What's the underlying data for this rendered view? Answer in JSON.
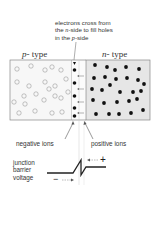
{
  "diagram": {
    "caption_lines": [
      "electrons cross from",
      "the n-side to fill holes",
      "in the p-side"
    ],
    "caption_parts": [
      [
        {
          "t": "electrons cross from",
          "i": false
        }
      ],
      [
        {
          "t": "the ",
          "i": false
        },
        {
          "t": "n",
          "i": true
        },
        {
          "t": "-side to fill holes",
          "i": false
        }
      ],
      [
        {
          "t": "in the ",
          "i": false
        },
        {
          "t": "p",
          "i": true
        },
        {
          "t": "-side",
          "i": false
        }
      ]
    ],
    "p_region": {
      "letter": "p",
      "suffix": "- type",
      "carrier": "holes"
    },
    "n_region": {
      "letter": "n",
      "suffix": "- type",
      "carrier": "electrons"
    },
    "negative_ions_label": "negative ions",
    "positive_ions_label": "positive ions",
    "barrier_label_lines": [
      "junction",
      "barrier",
      "voltage"
    ],
    "plus_sign": "+",
    "minus_sign": "−",
    "colors": {
      "p_fill": "#f7f7f7",
      "n_fill": "#e6e6e6",
      "border": "#888888",
      "dot": "#111111",
      "hole": "#9a9a9a"
    }
  }
}
